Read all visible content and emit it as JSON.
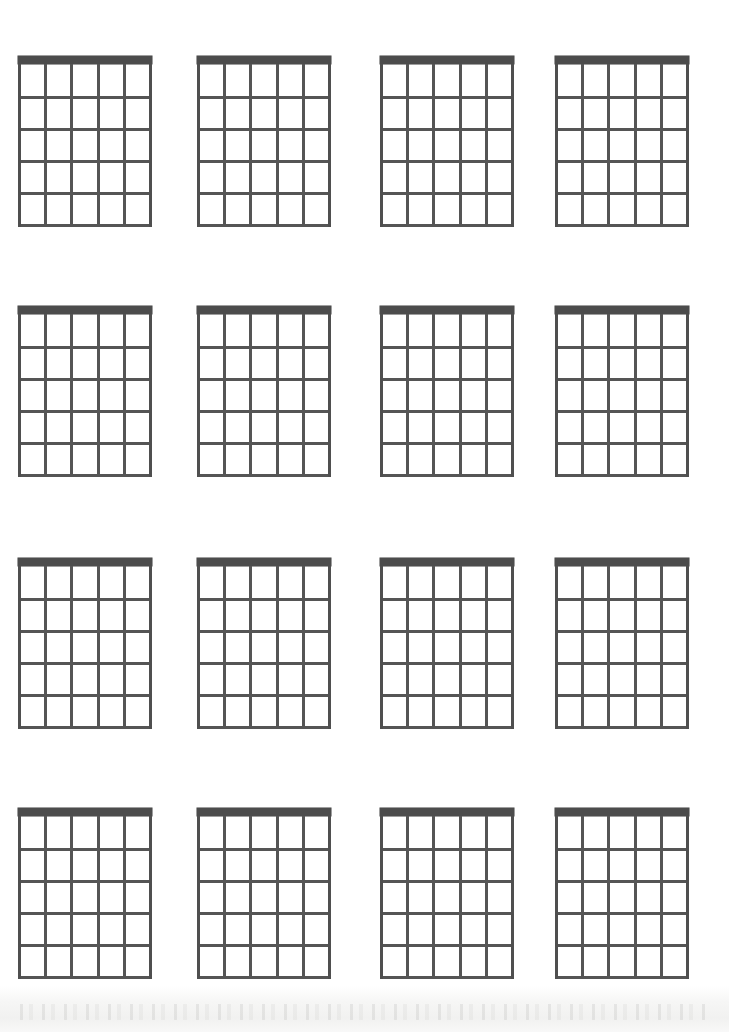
{
  "document": {
    "type": "blank-guitar-chord-chart",
    "title": "Blank Guitar Chord Diagram Sheet",
    "page_width": 729,
    "page_height": 1032,
    "background_color": "#ffffff",
    "ink_color": "#555555",
    "nut_color": "#4c4c4c"
  },
  "layout": {
    "columns": 4,
    "rows": 4,
    "diagram_count": 16,
    "column_x": [
      18,
      197,
      380,
      555
    ],
    "row_y": [
      56,
      306,
      558,
      808
    ],
    "diagram_width": 134,
    "diagram_height": 171
  },
  "diagram_spec": {
    "strings": 6,
    "string_gaps": 5,
    "frets": 5,
    "nut_height": 8,
    "fret_spacing": 32.6,
    "string_spacing": 26.2,
    "has_nut": true,
    "has_labels": false,
    "has_finger_dots": false,
    "has_chord_name": false
  },
  "diagrams": [
    {
      "index": 1,
      "row": 1,
      "col": 1,
      "name": "",
      "frets": [],
      "fingers": []
    },
    {
      "index": 2,
      "row": 1,
      "col": 2,
      "name": "",
      "frets": [],
      "fingers": []
    },
    {
      "index": 3,
      "row": 1,
      "col": 3,
      "name": "",
      "frets": [],
      "fingers": []
    },
    {
      "index": 4,
      "row": 1,
      "col": 4,
      "name": "",
      "frets": [],
      "fingers": []
    },
    {
      "index": 5,
      "row": 2,
      "col": 1,
      "name": "",
      "frets": [],
      "fingers": []
    },
    {
      "index": 6,
      "row": 2,
      "col": 2,
      "name": "",
      "frets": [],
      "fingers": []
    },
    {
      "index": 7,
      "row": 2,
      "col": 3,
      "name": "",
      "frets": [],
      "fingers": []
    },
    {
      "index": 8,
      "row": 2,
      "col": 4,
      "name": "",
      "frets": [],
      "fingers": []
    },
    {
      "index": 9,
      "row": 3,
      "col": 1,
      "name": "",
      "frets": [],
      "fingers": []
    },
    {
      "index": 10,
      "row": 3,
      "col": 2,
      "name": "",
      "frets": [],
      "fingers": []
    },
    {
      "index": 11,
      "row": 3,
      "col": 3,
      "name": "",
      "frets": [],
      "fingers": []
    },
    {
      "index": 12,
      "row": 3,
      "col": 4,
      "name": "",
      "frets": [],
      "fingers": []
    },
    {
      "index": 13,
      "row": 4,
      "col": 1,
      "name": "",
      "frets": [],
      "fingers": []
    },
    {
      "index": 14,
      "row": 4,
      "col": 2,
      "name": "",
      "frets": [],
      "fingers": []
    },
    {
      "index": 15,
      "row": 4,
      "col": 3,
      "name": "",
      "frets": [],
      "fingers": []
    },
    {
      "index": 16,
      "row": 4,
      "col": 4,
      "name": "",
      "frets": [],
      "fingers": []
    }
  ]
}
